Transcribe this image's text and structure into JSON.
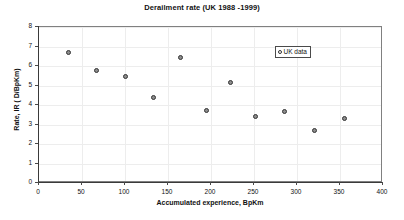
{
  "chart_data": {
    "type": "scatter",
    "title": "Derailment rate (UK 1988 -1999)",
    "xlabel": "Accumulated experience, BpKm",
    "ylabel": "Rate, IR ( D/BpKm)",
    "xlim": [
      0,
      400
    ],
    "ylim": [
      0,
      8
    ],
    "xticks": [
      0,
      50,
      100,
      150,
      200,
      250,
      300,
      350,
      400
    ],
    "yticks": [
      0,
      1,
      2,
      3,
      4,
      5,
      6,
      7,
      8
    ],
    "grid": true,
    "legend_position": "top-right",
    "series": [
      {
        "name": "UK data",
        "marker": "circle",
        "marker_color": "#8c8c8c",
        "marker_edge_color": "#333333",
        "points": [
          {
            "x": 34,
            "y": 6.7
          },
          {
            "x": 67,
            "y": 5.75
          },
          {
            "x": 100,
            "y": 5.48
          },
          {
            "x": 133,
            "y": 4.4
          },
          {
            "x": 165,
            "y": 6.45
          },
          {
            "x": 195,
            "y": 3.7
          },
          {
            "x": 223,
            "y": 5.15
          },
          {
            "x": 252,
            "y": 3.43
          },
          {
            "x": 285,
            "y": 3.67
          },
          {
            "x": 320,
            "y": 2.67
          },
          {
            "x": 355,
            "y": 3.3
          }
        ]
      }
    ]
  },
  "legend": {
    "entries": [
      {
        "label": "UK data",
        "marker": "circle-marker"
      }
    ]
  }
}
